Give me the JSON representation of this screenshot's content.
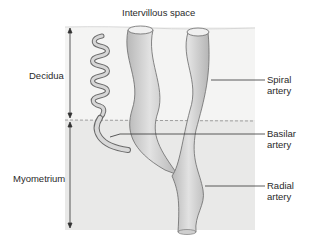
{
  "diagram": {
    "title_label": "Intervillous space",
    "layers": [
      {
        "name": "Decidua",
        "color": "#f4f4f3"
      },
      {
        "name": "Myometrium",
        "color": "#e9e9e8"
      }
    ],
    "vessels": [
      {
        "name": "Spiral artery",
        "label": "Spiral\nartery"
      },
      {
        "name": "Basilar artery",
        "label": "Basilar\nartery"
      },
      {
        "name": "Radial artery",
        "label": "Radial\nartery"
      }
    ],
    "colors": {
      "vessel_fill": "#c9c9c9",
      "vessel_highlight": "#e6e6e6",
      "vessel_outline": "#6a6a6a",
      "boundary_dash": "#8a8a8a",
      "leader_line": "#333333"
    }
  }
}
